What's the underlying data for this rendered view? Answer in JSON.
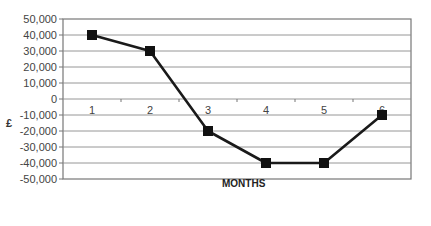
{
  "chart_data": {
    "type": "line",
    "title": "",
    "xlabel": "MONTHS",
    "ylabel": "£",
    "categories": [
      "1",
      "2",
      "3",
      "4",
      "5",
      "6"
    ],
    "series": [
      {
        "name": "Cash flow",
        "values": [
          40000,
          30000,
          -20000,
          -40000,
          -40000,
          -10000
        ]
      }
    ],
    "ylim": [
      -50000,
      50000
    ],
    "ytick_step": 10000,
    "ytick_labels": [
      "50,000",
      "40,000",
      "30,000",
      "20,000",
      "10,000",
      "0",
      "-10,000",
      "-20,000",
      "-30,000",
      "-40,000",
      "-50,000"
    ],
    "grid": true,
    "legend": "none",
    "marker": "square",
    "line_color": "#1a1a1a",
    "grid_color": "#8a8a8a"
  }
}
